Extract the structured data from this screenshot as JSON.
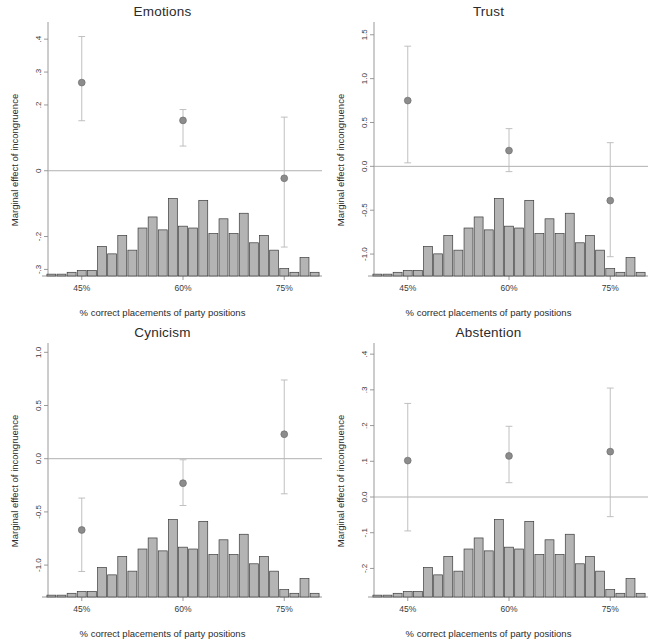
{
  "figure": {
    "width": 651,
    "height": 641,
    "background": "#ffffff",
    "layout": "2x2 small multiples",
    "marker_color": "#8c8c8c",
    "bar_fill": "#b4b4b4",
    "bar_edge": "#3c3c3c",
    "axis_color": "#8f8f8f",
    "zero_line_color": "#a8a8a8"
  },
  "panels": [
    {
      "key": "emotions",
      "title": "Emotions",
      "ylabel": "Marginal effect of incongruence",
      "xlabel": "% correct placements of party positions",
      "ytick_labels": [
        ".4",
        ".3",
        ".2",
        "0",
        "-.2",
        "-.3"
      ],
      "ytick_values": [
        0.4,
        0.3,
        0.2,
        0.0,
        -0.2,
        -0.3
      ],
      "xtick_labels": [
        "45%",
        "60%",
        "75%"
      ],
      "xtick_values": [
        45,
        60,
        75
      ]
    },
    {
      "key": "trust",
      "title": "Trust",
      "ylabel": "Marginal effect of incongruence",
      "xlabel": "% correct placements of party positions",
      "ytick_labels": [
        "1.5",
        "1.0",
        "0.5",
        "0.0",
        "-0.5",
        "-1.0"
      ],
      "ytick_values": [
        1.5,
        1.0,
        0.5,
        0.0,
        -0.5,
        -1.0
      ],
      "xtick_labels": [
        "45%",
        "60%",
        "75%"
      ],
      "xtick_values": [
        45,
        60,
        75
      ]
    },
    {
      "key": "cynicism",
      "title": "Cynicism",
      "ylabel": "Marginal effect of incongruence",
      "xlabel": "% correct placements of party positions",
      "ytick_labels": [
        "1.0",
        "0.5",
        "0.0",
        "-0.5",
        "-1.0"
      ],
      "ytick_values": [
        1.0,
        0.5,
        0.0,
        -0.5,
        -1.0
      ],
      "xtick_labels": [
        "45%",
        "60%",
        "75%"
      ],
      "xtick_values": [
        45,
        60,
        75
      ]
    },
    {
      "key": "abstention",
      "title": "Abstention",
      "ylabel": "Marginal effect of incongruence",
      "xlabel": "% correct placements of party positions",
      "ytick_labels": [
        ".4",
        ".3",
        ".2",
        ".1",
        "0.0",
        "-.1",
        "-.2"
      ],
      "ytick_values": [
        0.4,
        0.3,
        0.2,
        0.1,
        0.0,
        -0.1,
        -0.2
      ],
      "xtick_labels": [
        "45%",
        "60%",
        "75%"
      ],
      "xtick_values": [
        45,
        60,
        75
      ]
    }
  ],
  "chart_data": [
    {
      "type": "scatter",
      "panel": "emotions",
      "title": "Emotions",
      "xlabel": "% correct placements of party positions",
      "ylabel": "Marginal effect of incongruence",
      "xlim": [
        40,
        80
      ],
      "ylim": [
        -0.32,
        0.44
      ],
      "grid": false,
      "legend": "none",
      "zero_reference_line": 0,
      "xtick_labels": [
        "45%",
        "60%",
        "75%"
      ],
      "ytick_labels": [
        ".4",
        ".3",
        ".2",
        "0",
        "-.2",
        "-.3"
      ],
      "marginal_effects": {
        "x": [
          45,
          60,
          75
        ],
        "estimate": [
          0.268,
          0.153,
          -0.023
        ],
        "ci_low": [
          0.152,
          0.075,
          -0.232
        ],
        "ci_high": [
          0.408,
          0.186,
          0.163
        ]
      },
      "histogram": {
        "note": "overlaid density of % correct placements, drawn along bottom of panel",
        "bin_centers": [
          40.5,
          42,
          43.5,
          45,
          46.5,
          48,
          49.5,
          51,
          52.5,
          54,
          55.5,
          57,
          58.5,
          60,
          61.5,
          63,
          64.5,
          66,
          67.5,
          69,
          70.5,
          72,
          73.5,
          75,
          76.5,
          78,
          79.5
        ],
        "counts": [
          1,
          1,
          2,
          3,
          3,
          16,
          12,
          22,
          14,
          26,
          32,
          25,
          42,
          27,
          26,
          41,
          23,
          31,
          23,
          34,
          18,
          22,
          14,
          4,
          2,
          10,
          2
        ]
      }
    },
    {
      "type": "scatter",
      "panel": "trust",
      "title": "Trust",
      "xlabel": "% correct placements of party positions",
      "ylabel": "Marginal effect of incongruence",
      "xlim": [
        40,
        80
      ],
      "ylim": [
        -1.25,
        1.6
      ],
      "grid": false,
      "legend": "none",
      "zero_reference_line": 0,
      "xtick_labels": [
        "45%",
        "60%",
        "75%"
      ],
      "ytick_labels": [
        "1.5",
        "1.0",
        "0.5",
        "0.0",
        "-0.5",
        "-1.0"
      ],
      "marginal_effects": {
        "x": [
          45,
          60,
          75
        ],
        "estimate": [
          0.75,
          0.18,
          -0.39
        ],
        "ci_low": [
          0.04,
          -0.06,
          -1.03
        ],
        "ci_high": [
          1.37,
          0.43,
          0.27
        ]
      },
      "histogram": {
        "note": "overlaid density of % correct placements, drawn along bottom of panel",
        "bin_centers": [
          40.5,
          42,
          43.5,
          45,
          46.5,
          48,
          49.5,
          51,
          52.5,
          54,
          55.5,
          57,
          58.5,
          60,
          61.5,
          63,
          64.5,
          66,
          67.5,
          69,
          70.5,
          72,
          73.5,
          75,
          76.5,
          78,
          79.5
        ],
        "counts": [
          1,
          1,
          2,
          3,
          3,
          16,
          12,
          22,
          14,
          26,
          32,
          25,
          42,
          27,
          26,
          41,
          23,
          31,
          23,
          34,
          18,
          22,
          14,
          4,
          2,
          10,
          2
        ]
      }
    },
    {
      "type": "scatter",
      "panel": "cynicism",
      "title": "Cynicism",
      "xlabel": "% correct placements of party positions",
      "ylabel": "Marginal effect of incongruence",
      "xlim": [
        40,
        80
      ],
      "ylim": [
        -1.3,
        1.05
      ],
      "grid": false,
      "legend": "none",
      "zero_reference_line": 0,
      "xtick_labels": [
        "45%",
        "60%",
        "75%"
      ],
      "ytick_labels": [
        "1.0",
        "0.5",
        "0.0",
        "-0.5",
        "-1.0"
      ],
      "marginal_effects": {
        "x": [
          45,
          60,
          75
        ],
        "estimate": [
          -0.67,
          -0.23,
          0.23
        ],
        "ci_low": [
          -1.06,
          -0.44,
          -0.33
        ],
        "ci_high": [
          -0.37,
          -0.01,
          0.74
        ]
      },
      "histogram": {
        "note": "overlaid density of % correct placements, drawn along bottom of panel",
        "bin_centers": [
          40.5,
          42,
          43.5,
          45,
          46.5,
          48,
          49.5,
          51,
          52.5,
          54,
          55.5,
          57,
          58.5,
          60,
          61.5,
          63,
          64.5,
          66,
          67.5,
          69,
          70.5,
          72,
          73.5,
          75,
          76.5,
          78,
          79.5
        ],
        "counts": [
          1,
          1,
          2,
          3,
          3,
          16,
          12,
          22,
          14,
          26,
          32,
          25,
          42,
          27,
          26,
          41,
          23,
          31,
          23,
          34,
          18,
          22,
          14,
          4,
          2,
          10,
          2
        ]
      }
    },
    {
      "type": "scatter",
      "panel": "abstention",
      "title": "Abstention",
      "xlabel": "% correct placements of party positions",
      "ylabel": "Marginal effect of incongruence",
      "xlim": [
        40,
        80
      ],
      "ylim": [
        -0.28,
        0.42
      ],
      "grid": false,
      "legend": "none",
      "zero_reference_line": 0,
      "xtick_labels": [
        "45%",
        "60%",
        "75%"
      ],
      "ytick_labels": [
        ".4",
        ".3",
        ".2",
        ".1",
        "0.0",
        "-.1",
        "-.2"
      ],
      "marginal_effects": {
        "x": [
          45,
          60,
          75
        ],
        "estimate": [
          0.102,
          0.115,
          0.127
        ],
        "ci_low": [
          -0.095,
          0.04,
          -0.055
        ],
        "ci_high": [
          0.262,
          0.198,
          0.305
        ]
      },
      "histogram": {
        "note": "overlaid density of % correct placements, drawn along bottom of panel",
        "bin_centers": [
          40.5,
          42,
          43.5,
          45,
          46.5,
          48,
          49.5,
          51,
          52.5,
          54,
          55.5,
          57,
          58.5,
          60,
          61.5,
          63,
          64.5,
          66,
          67.5,
          69,
          70.5,
          72,
          73.5,
          75,
          76.5,
          78,
          79.5
        ],
        "counts": [
          1,
          1,
          2,
          3,
          3,
          16,
          12,
          22,
          14,
          26,
          32,
          25,
          42,
          27,
          26,
          41,
          23,
          31,
          23,
          34,
          18,
          22,
          14,
          4,
          2,
          10,
          2
        ]
      }
    }
  ]
}
